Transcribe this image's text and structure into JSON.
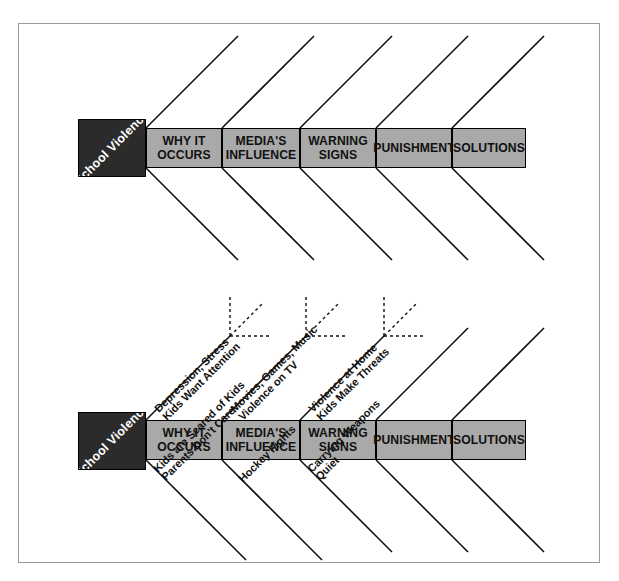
{
  "colors": {
    "head_box_fill": "#2b2b2b",
    "head_text": "#ffffff",
    "category_fill": "#a9a9a9",
    "line": "#111111",
    "frame_border": "#9a9a9a",
    "page_background": "#ffffff"
  },
  "diagrams": [
    {
      "id": "top-diagram",
      "head": {
        "line1": "School",
        "line2": "Violence"
      },
      "categories": [
        {
          "id": "why-it-occurs",
          "line1": "WHY IT",
          "line2": "OCCURS"
        },
        {
          "id": "medias-influence",
          "line1": "MEDIA'S",
          "line2": "INFLUENCE"
        },
        {
          "id": "warning-signs",
          "line1": "WARNING",
          "line2": "SIGNS"
        },
        {
          "id": "punishment",
          "line1": "PUNISHMENT",
          "line2": ""
        },
        {
          "id": "solutions",
          "line1": "SOLUTIONS",
          "line2": ""
        }
      ],
      "sub_causes_above": [],
      "sub_causes_below": []
    },
    {
      "id": "bottom-diagram",
      "head": {
        "line1": "School",
        "line2": "Violence"
      },
      "categories": [
        {
          "id": "why-it-occurs",
          "line1": "WHY IT",
          "line2": "OCCURS"
        },
        {
          "id": "medias-influence",
          "line1": "MEDIA'S",
          "line2": "INFLUENCE"
        },
        {
          "id": "warning-signs",
          "line1": "WARNING",
          "line2": "SIGNS"
        },
        {
          "id": "punishment",
          "line1": "PUNISHMENT",
          "line2": ""
        },
        {
          "id": "solutions",
          "line1": "SOLUTIONS",
          "line2": ""
        }
      ],
      "sub_causes_above": [
        {
          "category": "why-it-occurs",
          "outer": "Depression, Stress",
          "inner": "Kids Want Attention"
        },
        {
          "category": "medias-influence",
          "outer": "Movies, Games, Music",
          "inner": "Violence on TV"
        },
        {
          "category": "warning-signs",
          "outer": "Violence at Home",
          "inner": "Kids Make Threats"
        },
        {
          "category": "punishment",
          "outer": "",
          "inner": ""
        },
        {
          "category": "solutions",
          "outer": "",
          "inner": ""
        }
      ],
      "sub_causes_below": [
        {
          "category": "why-it-occurs",
          "outer": "Kids are Scared of Kids",
          "inner": "Parents Don't Care"
        },
        {
          "category": "medias-influence",
          "outer": "Hockey Fights",
          "inner": ""
        },
        {
          "category": "warning-signs",
          "outer": "Carrying Weapons",
          "inner": "Quiet"
        },
        {
          "category": "punishment",
          "outer": "",
          "inner": ""
        },
        {
          "category": "solutions",
          "outer": "",
          "inner": ""
        }
      ]
    }
  ]
}
